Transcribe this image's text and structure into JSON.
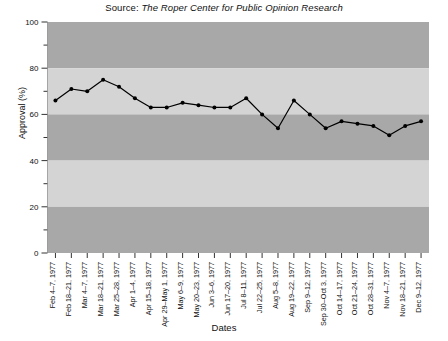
{
  "chart_data": {
    "type": "line",
    "title": "Source: The Roper Center for Public Opinion Research",
    "title_prefix": "Source:",
    "title_italic": "The Roper Center for Public Opinion Research",
    "xlabel": "Dates",
    "ylabel": "Approval (%)",
    "ylim": [
      0,
      100
    ],
    "ytick_values": [
      0,
      20,
      40,
      60,
      80,
      100
    ],
    "ytick_labels": [
      "0",
      "20",
      "40",
      "60",
      "80",
      "100"
    ],
    "yminor_values": [
      10,
      30,
      50,
      70,
      90
    ],
    "grid": false,
    "banded_background": true,
    "legend": "none",
    "marker": "filled-circle",
    "line_color": "#000000",
    "band_colors": [
      "#a8a8a8",
      "#d4d4d4"
    ],
    "categories": [
      "Feb 4–7, 1977",
      "Feb 18–21, 1977",
      "Mar 4–7, 1977",
      "Mar 18–21, 1977",
      "Mar 25–28, 1977",
      "Apr 1–4, 1977",
      "Apr 15–18, 1977",
      "Apr 29–May 1, 1977",
      "May 6–9, 1977",
      "May 20–23, 1977",
      "Jun 3–6, 1977",
      "Jun 17–20, 1977",
      "Jul 8–11, 1977",
      "Jul 22–25, 1977",
      "Aug 5–8, 1977",
      "Aug 19–22, 1977",
      "Sep 9–12, 1977",
      "Sep 30–Oct 3, 1977",
      "Oct 14–17, 1977",
      "Oct 21–24, 1977",
      "Oct 28–31, 1977",
      "Nov 4–7, 1977",
      "Nov 18–21, 1977",
      "Dec 9–12, 1977"
    ],
    "values": [
      66,
      71,
      70,
      75,
      72,
      67,
      63,
      63,
      65,
      64,
      63,
      63,
      67,
      60,
      54,
      66,
      60,
      54,
      57,
      56,
      55,
      51,
      55,
      57
    ],
    "values_extra_note": "approval percentages read from plot",
    "series": [
      {
        "name": "Approval",
        "values": [
          66,
          71,
          70,
          75,
          72,
          67,
          63,
          63,
          65,
          64,
          63,
          63,
          67,
          60,
          54,
          66,
          60,
          54,
          57,
          56,
          55,
          51,
          55,
          57
        ]
      }
    ]
  }
}
